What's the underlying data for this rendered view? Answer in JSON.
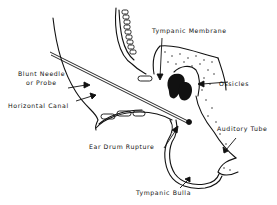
{
  "diagram": {
    "type": "anatomical-illustration",
    "colors": {
      "ink": "#111111",
      "background": "#ffffff"
    },
    "labels": {
      "tympanic_membrane": "Tympanic Membrane",
      "blunt_needle_line1": "Blunt Needle",
      "blunt_needle_line2": "or Probe",
      "horizontal_canal": "Horizontal Canal",
      "ossicles": "Ossicles",
      "ear_drum_rupture": "Ear Drum Rupture",
      "auditory_tube": "Auditory Tube",
      "tympanic_bulla": "Tympanic Bulla"
    }
  }
}
